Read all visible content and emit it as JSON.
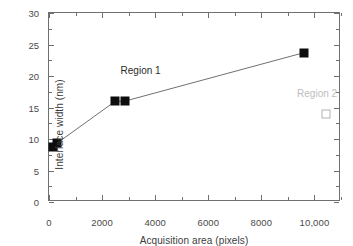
{
  "chart_data": {
    "type": "scatter",
    "title": "",
    "xlabel": "Acquisition area (pixels)",
    "ylabel": "Interface width (nm)",
    "xlim": [
      0,
      11000
    ],
    "ylim": [
      0,
      30
    ],
    "grid": false,
    "legend_position": "none",
    "x_ticks": [
      {
        "value": 0,
        "label": "0"
      },
      {
        "value": 2000,
        "label": "2000"
      },
      {
        "value": 4000,
        "label": "4000"
      },
      {
        "value": 6000,
        "label": "6000"
      },
      {
        "value": 8000,
        "label": "8000"
      },
      {
        "value": 10000,
        "label": "10,000"
      }
    ],
    "x_minor_ticks": [
      1000,
      3000,
      5000,
      7000,
      9000,
      11000
    ],
    "y_ticks": [
      {
        "value": 0,
        "label": "0"
      },
      {
        "value": 5,
        "label": "5"
      },
      {
        "value": 10,
        "label": "10"
      },
      {
        "value": 15,
        "label": "15"
      },
      {
        "value": 20,
        "label": "20"
      },
      {
        "value": 25,
        "label": "25"
      },
      {
        "value": 30,
        "label": "30"
      }
    ],
    "y_minor_ticks": [
      2.5,
      7.5,
      12.5,
      17.5,
      22.5,
      27.5
    ],
    "series": [
      {
        "name": "Region 1",
        "marker": "filled-square",
        "color": "#0d0d0d",
        "line": true,
        "line_color": "#707070",
        "points": [
          {
            "x": 150,
            "y": 8.7
          },
          {
            "x": 290,
            "y": 9.3
          },
          {
            "x": 2500,
            "y": 16.0
          },
          {
            "x": 2850,
            "y": 16.0
          },
          {
            "x": 9600,
            "y": 23.7
          }
        ]
      },
      {
        "name": "Region 2",
        "marker": "open-square",
        "color": "#b2b2b2",
        "line": false,
        "points": [
          {
            "x": 10450,
            "y": 13.9
          }
        ]
      }
    ],
    "annotations": [
      {
        "id": "region-1",
        "text": "Region 1",
        "x": 3450,
        "y": 20.9,
        "color": "#2b2b2b"
      },
      {
        "id": "region-2",
        "text": "Region 2",
        "x": 10100,
        "y": 17.3,
        "color": "#bdbdbd"
      }
    ]
  },
  "figure": {
    "background_color": "#ffffff",
    "axis_color": "#6f6f6f",
    "tick_label_color": "#4a4a4a",
    "axis_title_color": "#3c3c3c"
  }
}
